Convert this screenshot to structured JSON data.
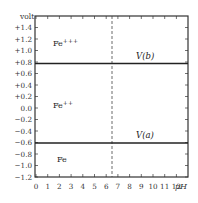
{
  "chart_data": {
    "type": "line",
    "title": "",
    "xlabel": "pH",
    "ylabel": "volt",
    "xlim": [
      0,
      13
    ],
    "ylim": [
      -1.2,
      1.6
    ],
    "x_ticks": [
      0,
      1,
      2,
      3,
      4,
      5,
      6,
      7,
      8,
      9,
      10,
      11,
      12
    ],
    "x_tick_labels": [
      "0",
      "1",
      "2",
      "3",
      "4",
      "5",
      "6",
      "7",
      "8",
      "9",
      "10",
      "11",
      "12"
    ],
    "y_ticks": [
      1.4,
      1.2,
      1.0,
      0.8,
      0.6,
      0.4,
      0.2,
      0.0,
      -0.2,
      -0.4,
      -0.6,
      -0.8,
      -1.0,
      -1.2
    ],
    "y_tick_labels": [
      "+1.4",
      "+1.2",
      "+1.0",
      "+0.8",
      "+0.6",
      "+0.4",
      "+0.2",
      "0.0",
      "−0.2",
      "−0.4",
      "−0.6",
      "−0.8",
      "−1.0",
      "−1.2"
    ],
    "grid": false,
    "series": [
      {
        "name": "V(b)",
        "x": [
          0,
          13
        ],
        "y": [
          0.77,
          0.77
        ],
        "style": "solid"
      },
      {
        "name": "V(a)",
        "x": [
          0,
          13
        ],
        "y": [
          -0.6,
          -0.6
        ],
        "style": "solid"
      },
      {
        "name": "neutral pH",
        "x": [
          7,
          7
        ],
        "y": [
          -1.2,
          1.6
        ],
        "style": "dashed"
      }
    ],
    "annotations": [
      {
        "text": "Fe",
        "sup": "+++",
        "x": 1.5,
        "y": 1.15
      },
      {
        "text": "Fe",
        "sup": "++",
        "x": 1.5,
        "y": 0.05
      },
      {
        "text": "Fe",
        "sup": "",
        "x": 1.6,
        "y": -0.95
      },
      {
        "text": "V(b)",
        "x": 10.4,
        "y": 0.88
      },
      {
        "text": "V(a)",
        "x": 10.4,
        "y": -0.46
      }
    ]
  },
  "labels": {
    "y_axis_title": "volt",
    "x_axis_title": "pH",
    "fe3": "Fe",
    "fe3_sup": "+++",
    "fe2": "Fe",
    "fe2_sup": "++",
    "fe": "Fe",
    "vb": "V(b)",
    "va": "V(a)"
  }
}
